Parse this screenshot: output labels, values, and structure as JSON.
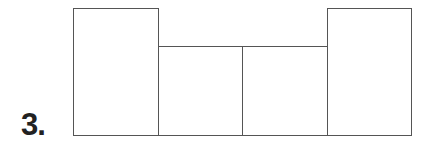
{
  "problem": {
    "number_label": "3."
  },
  "figure": {
    "type": "net-of-rectangles",
    "stroke_color": "#555555",
    "rectangles": [
      {
        "name": "tall-left",
        "x": 73,
        "y": 8,
        "w": 86,
        "h": 128
      },
      {
        "name": "short-mid-left",
        "x": 158,
        "y": 46,
        "w": 85,
        "h": 90
      },
      {
        "name": "short-mid-right",
        "x": 242,
        "y": 46,
        "w": 86,
        "h": 90
      },
      {
        "name": "tall-right",
        "x": 327,
        "y": 8,
        "w": 85,
        "h": 128
      }
    ]
  }
}
